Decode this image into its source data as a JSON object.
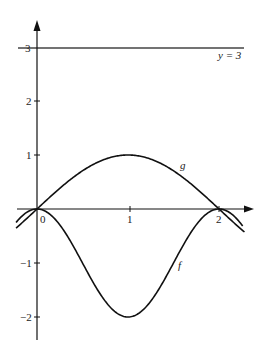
{
  "chart_data": {
    "type": "line",
    "title": "",
    "xlabel": "",
    "ylabel": "",
    "x_ticks": [
      "0",
      "1",
      "2"
    ],
    "y_ticks": [
      "3",
      "2",
      "1",
      "-1",
      "-2"
    ],
    "xlim": [
      -0.22,
      2.37
    ],
    "ylim": [
      -2.2,
      3.5
    ],
    "grid": false,
    "legend": null,
    "series": [
      {
        "name": "f",
        "formula": "f(x) = cos(pi x) - 1",
        "x": [
          -0.2,
          0,
          0.25,
          0.5,
          0.75,
          1,
          1.25,
          1.5,
          1.75,
          2,
          2.25
        ],
        "values": [
          -0.19,
          0,
          -0.29,
          -1,
          -1.71,
          -2,
          -1.71,
          -1,
          -0.29,
          0,
          -0.29
        ]
      },
      {
        "name": "g",
        "formula": "g(x) = sin(pi x / 2)",
        "x": [
          -0.2,
          0,
          0.25,
          0.5,
          0.75,
          1,
          1.25,
          1.5,
          1.75,
          2,
          2.25
        ],
        "values": [
          -0.31,
          0,
          0.38,
          0.71,
          0.92,
          1,
          0.92,
          0.71,
          0.38,
          0,
          -0.38
        ]
      },
      {
        "name": "y = 3",
        "formula": "y = 3",
        "x": [
          -0.2,
          2.3
        ],
        "values": [
          3,
          3
        ]
      }
    ],
    "annotations": [
      "y = 3",
      "g",
      "f"
    ]
  },
  "labels": {
    "origin": "0",
    "x1": "1",
    "x2": "2",
    "y3": "3",
    "y2": "2",
    "y1": "1",
    "ym1": "−1",
    "ym2": "−2",
    "line_label": "y = 3",
    "g_label": "g",
    "f_label": "f"
  }
}
